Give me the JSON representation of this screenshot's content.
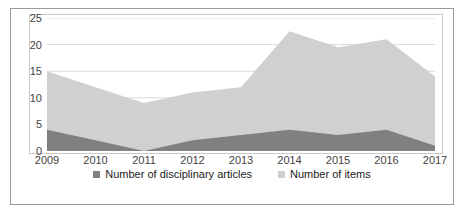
{
  "chart_data": {
    "type": "area",
    "stacked": true,
    "title": "",
    "xlabel": "",
    "ylabel": "",
    "categories": [
      "2009",
      "2010",
      "2011",
      "2012",
      "2013",
      "2014",
      "2015",
      "2016",
      "2017"
    ],
    "x_tick_labels": [
      "2009",
      "2010",
      "2011",
      "2012",
      "2013",
      "2014",
      "2015",
      "2016",
      "2017"
    ],
    "y_tick_labels": [
      "0",
      "5",
      "10",
      "15",
      "20",
      "25"
    ],
    "y_ticks": [
      0,
      5,
      10,
      15,
      20,
      25
    ],
    "ylim": [
      0,
      25
    ],
    "grid": "horizontal",
    "legend_position": "bottom",
    "series": [
      {
        "name": "Number of disciplinary articles",
        "color": "#808080",
        "values": [
          4,
          2,
          0,
          2,
          3,
          4,
          3,
          4,
          1
        ]
      },
      {
        "name": "Number of items",
        "color": "#d0d0d0",
        "values": [
          15,
          12,
          9,
          11,
          12,
          22.5,
          19.5,
          21,
          14
        ]
      }
    ]
  },
  "legend": {
    "entries": [
      {
        "label": "Number of disciplinary articles",
        "color": "#808080"
      },
      {
        "label": "Number of items",
        "color": "#d0d0d0"
      }
    ]
  },
  "colors": {
    "series_dark": "#808080",
    "series_light": "#d0d0d0",
    "gridline": "#d9d9d9",
    "axis_text": "#444444",
    "outer_border": "#9a9a9a",
    "plot_border": "#c9c9c9"
  }
}
